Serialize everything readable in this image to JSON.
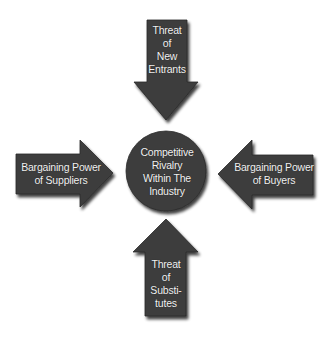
{
  "diagram": {
    "colors": {
      "shape_fill": "#3d3d3d",
      "text": "#f2f2f2",
      "background": "#ffffff"
    },
    "center": {
      "shape": "circle",
      "label": "Competitive\nRivalry\nWithin The\nIndustry"
    },
    "forces": {
      "top": {
        "direction": "down",
        "label": "Threat\nof\nNew\nEntrants"
      },
      "left": {
        "direction": "right",
        "label": "Bargaining Power\nof Suppliers"
      },
      "right": {
        "direction": "left",
        "label": "Bargaining Power\nof Buyers"
      },
      "bottom": {
        "direction": "up",
        "label": "Threat\nof\nSubsti-\ntutes"
      }
    }
  }
}
